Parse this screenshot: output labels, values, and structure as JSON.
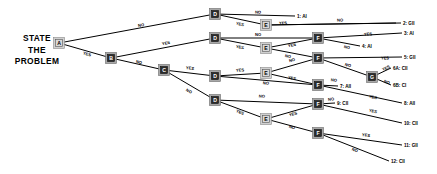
{
  "diagram": {
    "title_lines": [
      "STATE",
      "THE",
      "PROBLEM"
    ],
    "type": "decision-tree",
    "nodes": [
      {
        "id": "A",
        "label": "A",
        "x": 59,
        "y": 43,
        "style": "light"
      },
      {
        "id": "B",
        "label": "B",
        "x": 111,
        "y": 58,
        "style": "dark"
      },
      {
        "id": "C1",
        "label": "C",
        "x": 164,
        "y": 70,
        "style": "dark"
      },
      {
        "id": "D1",
        "label": "D",
        "x": 215,
        "y": 14,
        "style": "dark"
      },
      {
        "id": "D2",
        "label": "D",
        "x": 215,
        "y": 38,
        "style": "dark"
      },
      {
        "id": "D3",
        "label": "D",
        "x": 215,
        "y": 76,
        "style": "dark"
      },
      {
        "id": "D4",
        "label": "D",
        "x": 215,
        "y": 100,
        "style": "dark"
      },
      {
        "id": "E1",
        "label": "E",
        "x": 266,
        "y": 25,
        "style": "light"
      },
      {
        "id": "E2",
        "label": "E",
        "x": 266,
        "y": 48,
        "style": "light"
      },
      {
        "id": "E3",
        "label": "E",
        "x": 266,
        "y": 73,
        "style": "light"
      },
      {
        "id": "E4",
        "label": "E",
        "x": 266,
        "y": 119,
        "style": "light"
      },
      {
        "id": "F1",
        "label": "F",
        "x": 318,
        "y": 38,
        "style": "dark"
      },
      {
        "id": "F2",
        "label": "F",
        "x": 318,
        "y": 58,
        "style": "dark"
      },
      {
        "id": "F3",
        "label": "F",
        "x": 318,
        "y": 85,
        "style": "dark"
      },
      {
        "id": "F4",
        "label": "F",
        "x": 318,
        "y": 104,
        "style": "dark"
      },
      {
        "id": "F5",
        "label": "F",
        "x": 318,
        "y": 133,
        "style": "dark"
      },
      {
        "id": "G",
        "label": "G",
        "x": 372,
        "y": 77,
        "style": "dark"
      }
    ],
    "edges": [
      {
        "from": "A",
        "to": "D1",
        "label": "NO",
        "lx": 141,
        "ly": 25
      },
      {
        "from": "A",
        "to": "B",
        "label": "YES",
        "lx": 87,
        "ly": 54
      },
      {
        "from": "B",
        "to": "D2",
        "label": "YES",
        "lx": 166,
        "ly": 43
      },
      {
        "from": "B",
        "to": "C1",
        "label": "NO",
        "lx": 139,
        "ly": 62
      },
      {
        "from": "C1",
        "to": "D3",
        "label": "YES",
        "lx": 190,
        "ly": 68
      },
      {
        "from": "C1",
        "to": "D4",
        "label": "NO",
        "lx": 189,
        "ly": 91
      },
      {
        "from": "D1",
        "to": "out1",
        "label": "NO",
        "lx": 258,
        "ly": 12
      },
      {
        "from": "D1",
        "to": "E1",
        "label": "YES",
        "lx": 240,
        "ly": 24
      },
      {
        "from": "E1",
        "to": "out2",
        "label": "YES",
        "lx": 283,
        "ly": 23
      },
      {
        "from": "E1",
        "to": "out2b",
        "label": "NO",
        "lx": 340,
        "ly": 20
      },
      {
        "from": "D2",
        "to": "F1",
        "label": "NO",
        "lx": 258,
        "ly": 34
      },
      {
        "from": "D2",
        "to": "E2",
        "label": "YES",
        "lx": 240,
        "ly": 47
      },
      {
        "from": "E2",
        "to": "F1",
        "label": "YES",
        "lx": 292,
        "ly": 45
      },
      {
        "from": "E2",
        "to": "F2",
        "label": "NO",
        "lx": 288,
        "ly": 56
      },
      {
        "from": "F1",
        "to": "out3",
        "label": "YES",
        "lx": 368,
        "ly": 34
      },
      {
        "from": "F1",
        "to": "out4",
        "label": "NO",
        "lx": 347,
        "ly": 47
      },
      {
        "from": "F2",
        "to": "out5",
        "label": "YES",
        "lx": 385,
        "ly": 58
      },
      {
        "from": "F2",
        "to": "G",
        "label": "NO",
        "lx": 348,
        "ly": 65
      },
      {
        "from": "G",
        "to": "out6a",
        "label": "YES",
        "lx": 386,
        "ly": 68
      },
      {
        "from": "G",
        "to": "out6b",
        "label": "NO",
        "lx": 387,
        "ly": 82
      },
      {
        "from": "D3",
        "to": "E3",
        "label": "YES",
        "lx": 240,
        "ly": 70
      },
      {
        "from": "D3",
        "to": "F3",
        "label": "NO",
        "lx": 266,
        "ly": 83
      },
      {
        "from": "E3",
        "to": "F2",
        "label": "NO",
        "lx": 292,
        "ly": 60
      },
      {
        "from": "E3",
        "to": "F3",
        "label": "YES",
        "lx": 292,
        "ly": 78
      },
      {
        "from": "F3",
        "to": "out7",
        "label": "NO",
        "lx": 334,
        "ly": 80
      },
      {
        "from": "F3",
        "to": "out8",
        "label": "YES",
        "lx": 373,
        "ly": 97
      },
      {
        "from": "D4",
        "to": "F4",
        "label": "NO",
        "lx": 262,
        "ly": 96
      },
      {
        "from": "D4",
        "to": "E4",
        "label": "YES",
        "lx": 240,
        "ly": 112
      },
      {
        "from": "E4",
        "to": "F4",
        "label": "YES",
        "lx": 293,
        "ly": 114
      },
      {
        "from": "E4",
        "to": "F5",
        "label": "NO",
        "lx": 292,
        "ly": 127
      },
      {
        "from": "F4",
        "to": "out9",
        "label": "NO",
        "lx": 331,
        "ly": 99
      },
      {
        "from": "F4",
        "to": "out10",
        "label": "YES",
        "lx": 373,
        "ly": 111
      },
      {
        "from": "F5",
        "to": "out11",
        "label": "YES",
        "lx": 366,
        "ly": 135
      },
      {
        "from": "F5",
        "to": "out12",
        "label": "NO",
        "lx": 355,
        "ly": 150
      }
    ],
    "outcomes": [
      {
        "id": "out1",
        "text": "1: AI",
        "x": 297,
        "y": 16
      },
      {
        "id": "out2",
        "text": "2: GII",
        "x": 403,
        "y": 23
      },
      {
        "id": "out3",
        "text": "3: AI",
        "x": 404,
        "y": 33
      },
      {
        "id": "out4",
        "text": "4: AI",
        "x": 362,
        "y": 46
      },
      {
        "id": "out5",
        "text": "5: GII",
        "x": 404,
        "y": 57
      },
      {
        "id": "out6a",
        "text": "6A: CII",
        "x": 393,
        "y": 68
      },
      {
        "id": "out6b",
        "text": "6B: CI",
        "x": 393,
        "y": 85
      },
      {
        "id": "out7",
        "text": "7: AII",
        "x": 340,
        "y": 86
      },
      {
        "id": "out8",
        "text": "8: AII",
        "x": 404,
        "y": 103
      },
      {
        "id": "out9",
        "text": "9: CII",
        "x": 337,
        "y": 103
      },
      {
        "id": "out10",
        "text": "10: CII",
        "x": 404,
        "y": 123
      },
      {
        "id": "out11",
        "text": "11: GII",
        "x": 404,
        "y": 145
      },
      {
        "id": "out12",
        "text": "12: CII",
        "x": 391,
        "y": 161
      }
    ],
    "colors": {
      "background": "#ffffff",
      "line": "#000000",
      "node_dark_fill": "#2b2b2b",
      "node_gray_border": "#a8a8a8",
      "node_light_fill": "#d8d8d8",
      "text": "#000000"
    }
  }
}
